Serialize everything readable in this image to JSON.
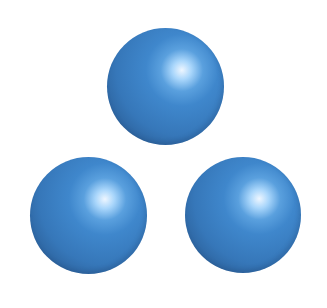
{
  "scene": {
    "description": "Three glossy blue spheres arranged in a triangle",
    "background_color": "#ffffff",
    "colors": {
      "highlight_core": "#eef6ff",
      "highlight": "#a9d6fb",
      "light": "#5aa0de",
      "base": "#3f87cc",
      "mid": "#3677b9",
      "shadow": "#2b5f98",
      "rim": "#244f80"
    },
    "spheres": [
      {
        "id": "top",
        "cx": 165,
        "cy": 86,
        "d": 117
      },
      {
        "id": "bottom-left",
        "cx": 88,
        "cy": 215,
        "d": 117
      },
      {
        "id": "bottom-right",
        "cx": 243,
        "cy": 215,
        "d": 116
      }
    ],
    "highlight_position": {
      "x_pct": 64,
      "y_pct": 36
    }
  }
}
